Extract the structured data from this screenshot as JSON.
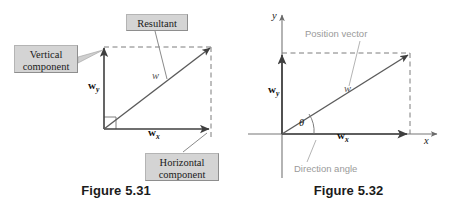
{
  "page": {
    "background_color": "#ffffff",
    "width": 465,
    "height": 207
  },
  "figures": [
    {
      "id": "figure-5-31",
      "caption": "Figure 5.31",
      "callouts": [
        {
          "name": "vertical-component",
          "label": "Vertical\ncomponent"
        },
        {
          "name": "resultant",
          "label": "Resultant"
        },
        {
          "name": "horizontal-component",
          "label": "Horizontal\ncomponent"
        }
      ],
      "vector_labels": {
        "vertical": "w",
        "vertical_sub": "y",
        "horizontal": "w",
        "horizontal_sub": "x",
        "resultant": "w"
      },
      "colors": {
        "callout_fill": "#d4d4d4",
        "callout_border": "#b4b4b4",
        "vector_stroke": "#4d4d4d",
        "dashed_stroke": "#7d7d7d",
        "text": "#1a1a1a"
      }
    },
    {
      "id": "figure-5-32",
      "caption": "Figure 5.32",
      "annotations": [
        {
          "name": "position-vector",
          "label": "Position vector"
        },
        {
          "name": "direction-angle",
          "label": "Direction angle"
        }
      ],
      "axis_labels": {
        "x": "x",
        "y": "y"
      },
      "vector_labels": {
        "vertical": "w",
        "vertical_sub": "y",
        "horizontal": "w",
        "horizontal_sub": "x",
        "resultant": "w",
        "angle": "θ"
      },
      "colors": {
        "annotation_text": "#9a9a9a",
        "vector_stroke": "#4d4d4d",
        "axis_stroke": "#555555",
        "dashed_stroke": "#7d7d7d",
        "text": "#111111"
      }
    }
  ]
}
